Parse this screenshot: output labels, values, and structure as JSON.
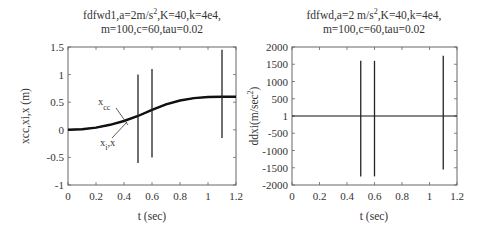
{
  "chart_data": [
    {
      "type": "line",
      "title": [
        "fdfwd1,a=2m/s²,K=40,k=4e4,",
        "m=100,c=60,tau=0.02"
      ],
      "xlabel": "t (sec)",
      "ylabel": "xcc,xi,x (m)",
      "xlim": [
        0,
        1.2
      ],
      "ylim": [
        -1,
        1.5
      ],
      "xticks": [
        "0",
        "0.2",
        "0.4",
        "0.6",
        "0.8",
        "1",
        "1.2"
      ],
      "yticks": [
        "-1",
        "-0.5",
        "0",
        "0.5",
        "1",
        "1.5"
      ],
      "grid": false,
      "annotations": [
        "x_cc",
        "x_i,x"
      ],
      "series": [
        {
          "name": "xcc",
          "x": [
            0,
            0.1,
            0.2,
            0.3,
            0.4,
            0.5,
            0.6,
            0.7,
            0.8,
            0.9,
            1.0,
            1.1,
            1.2
          ],
          "values": [
            0,
            0.01,
            0.04,
            0.09,
            0.16,
            0.25,
            0.36,
            0.46,
            0.53,
            0.575,
            0.595,
            0.6,
            0.6
          ]
        },
        {
          "name": "xi,x",
          "x": [
            0,
            0.1,
            0.2,
            0.3,
            0.4,
            0.5,
            0.6,
            0.7,
            0.8,
            0.9,
            1.0,
            1.1,
            1.2
          ],
          "values": [
            0,
            0.01,
            0.04,
            0.09,
            0.16,
            0.25,
            0.36,
            0.46,
            0.53,
            0.575,
            0.595,
            0.6,
            0.6
          ]
        }
      ],
      "spikes": [
        {
          "t": 0.5,
          "max": 1.0,
          "min": -0.6
        },
        {
          "t": 0.6,
          "max": 1.1,
          "min": -0.5
        },
        {
          "t": 1.1,
          "max": 1.45,
          "min": -0.15
        }
      ]
    },
    {
      "type": "line",
      "title": [
        "fdfwd,a=2 m/s²,K=40,k=4e4,",
        "m=100,c=60,tau=0.02"
      ],
      "xlabel": "t (sec)",
      "ylabel": "ddxi(m/sec²)",
      "xlim": [
        0,
        1.2
      ],
      "ylim": [
        -2000,
        2000
      ],
      "xticks": [
        "0",
        "0.2",
        "0.4",
        "0.6",
        "0.8",
        "1",
        "1.2"
      ],
      "yticks": [
        "-2000",
        "-1500",
        "-1000",
        "-500",
        "1",
        "500",
        "1000",
        "1500",
        "2000"
      ],
      "grid": false,
      "series": [
        {
          "name": "ddxi",
          "x": [
            0,
            1.2
          ],
          "values": [
            0,
            0
          ]
        }
      ],
      "spikes": [
        {
          "t": 0.5,
          "max": 1600,
          "min": -1750
        },
        {
          "t": 0.6,
          "max": 1600,
          "min": -1750
        },
        {
          "t": 1.1,
          "max": 1750,
          "min": -1550
        }
      ]
    }
  ]
}
